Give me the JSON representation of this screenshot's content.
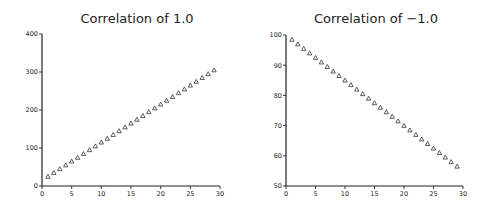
{
  "chart_data": [
    {
      "type": "scatter",
      "title": "Correlation of 1.0",
      "xlabel": "",
      "ylabel": "",
      "xlim": [
        0,
        30
      ],
      "ylim": [
        0,
        400
      ],
      "xticks": [
        0,
        5,
        10,
        15,
        20,
        25,
        30
      ],
      "yticks": [
        0,
        100,
        200,
        300,
        400
      ],
      "grid": false,
      "legend": null,
      "marker": "triangle-open",
      "x": [
        1,
        2,
        3,
        4,
        5,
        6,
        7,
        8,
        9,
        10,
        11,
        12,
        13,
        14,
        15,
        16,
        17,
        18,
        19,
        20,
        21,
        22,
        23,
        24,
        25,
        26,
        27,
        28,
        29
      ],
      "y": [
        25,
        35,
        45,
        55,
        65,
        75,
        85,
        95,
        105,
        115,
        125,
        135,
        145,
        155,
        165,
        175,
        185,
        195,
        205,
        215,
        225,
        235,
        245,
        255,
        265,
        275,
        285,
        295,
        305
      ]
    },
    {
      "type": "scatter",
      "title": "Correlation of −1.0",
      "xlabel": "",
      "ylabel": "",
      "xlim": [
        0,
        30
      ],
      "ylim": [
        50,
        100
      ],
      "xticks": [
        0,
        5,
        10,
        15,
        20,
        25,
        30
      ],
      "yticks": [
        50,
        60,
        70,
        80,
        90,
        100
      ],
      "grid": false,
      "legend": null,
      "marker": "triangle-open",
      "x": [
        1,
        2,
        3,
        4,
        5,
        6,
        7,
        8,
        9,
        10,
        11,
        12,
        13,
        14,
        15,
        16,
        17,
        18,
        19,
        20,
        21,
        22,
        23,
        24,
        25,
        26,
        27,
        28,
        29
      ],
      "y": [
        98.5,
        97,
        95.5,
        94,
        92.5,
        91,
        89.5,
        88,
        86.5,
        85,
        83.5,
        82,
        80.5,
        79,
        77.5,
        76,
        74.5,
        73,
        71.5,
        70,
        68.5,
        67,
        65.5,
        64,
        62.5,
        61,
        59.5,
        58,
        56.5
      ]
    }
  ],
  "panels": [
    {
      "title": "Correlation of 1.0"
    },
    {
      "title": "Correlation of −1.0"
    }
  ]
}
